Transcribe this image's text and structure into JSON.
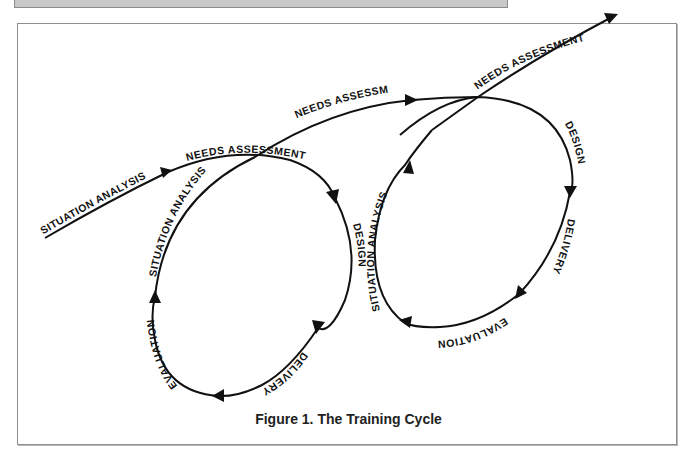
{
  "figure": {
    "caption": "Figure 1. The Training Cycle"
  },
  "diagram": {
    "type": "spiral-cycle",
    "line_color": "#111111",
    "background": "#ffffff",
    "frame_border_color": "#8f8f8f",
    "header_bar_color": "#c9c9c9",
    "entry_labels": {
      "situation_analysis": "SITUATION ANALYSIS",
      "needs_assessment": "NEEDS ASSESSMENT"
    },
    "cycle_1": {
      "needs_assessment": "NEEDS ASSESSMENT",
      "design": "DESIGN",
      "delivery": "DELIVERY",
      "evaluation": "EVALUATION",
      "situation_analysis": "SITUATION ANALYSIS"
    },
    "bridge": {
      "needs_assessment": "NEEDS ASSESSMENT"
    },
    "cycle_2": {
      "needs_assessment": "NEEDS ASSESSMENT",
      "design": "DESIGN",
      "delivery": "DELIVERY",
      "evaluation": "EVALUATION",
      "situation_analysis": "SITUATION ANALYSIS"
    },
    "flow_order": [
      "Situation Analysis",
      "Needs Assessment",
      "Design",
      "Delivery",
      "Evaluation",
      "Situation Analysis",
      "Needs Assessment",
      "Design",
      "Delivery",
      "Evaluation",
      "Situation Analysis",
      "Needs Assessment"
    ]
  }
}
